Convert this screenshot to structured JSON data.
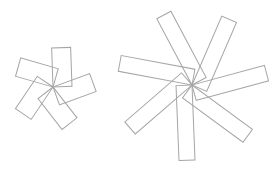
{
  "scene": {
    "background_color": "#ffffff",
    "stroke_color": "#a5a5a5",
    "stroke_width": 1,
    "canvas": {
      "width": 279,
      "height": 177
    },
    "pinwheels": [
      {
        "name": "left-pinwheel",
        "cx": 53,
        "cy": 87,
        "petals": 5,
        "petal_length": 39,
        "petal_width": 19,
        "start_angle_deg": 92,
        "step_angle_deg": 72,
        "chirality": "clockwise"
      },
      {
        "name": "right-pinwheel",
        "cx": 192,
        "cy": 85,
        "petals": 7,
        "petal_length": 75,
        "petal_width": 16,
        "start_angle_deg": 118,
        "step_angle_deg": 51.4286,
        "chirality": "clockwise"
      }
    ]
  }
}
